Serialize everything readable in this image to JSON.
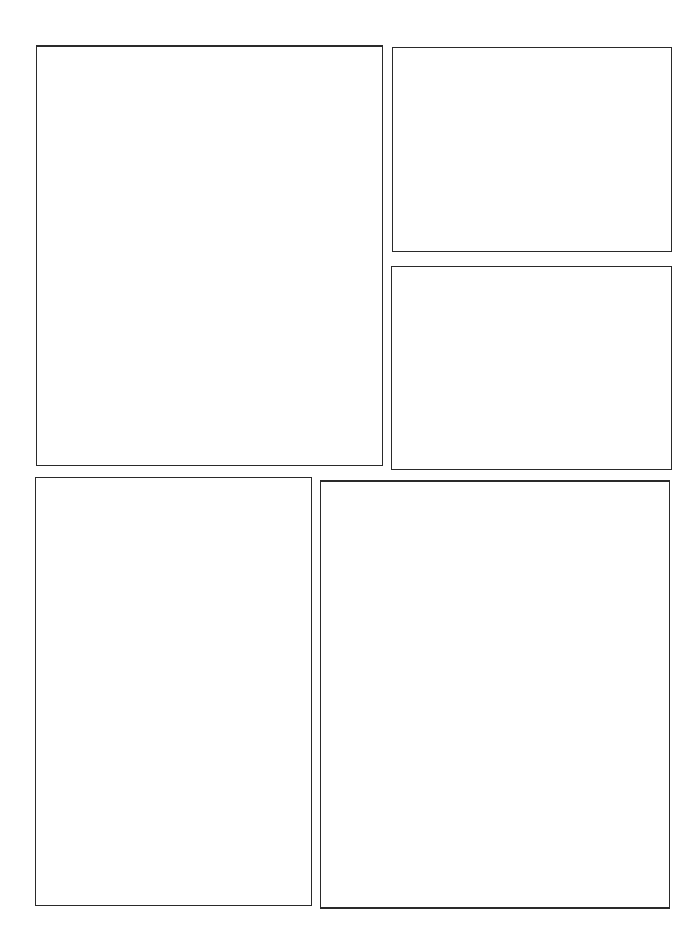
{
  "page": {
    "type": "comic-page-template",
    "background_color": "#ffffff",
    "border_color": "#2a2a2a",
    "panel_count": 5
  },
  "panels": [
    {
      "id": 1,
      "label": "",
      "content": ""
    },
    {
      "id": 2,
      "label": "",
      "content": ""
    },
    {
      "id": 3,
      "label": "",
      "content": ""
    },
    {
      "id": 4,
      "label": "",
      "content": ""
    },
    {
      "id": 5,
      "label": "",
      "content": ""
    }
  ]
}
